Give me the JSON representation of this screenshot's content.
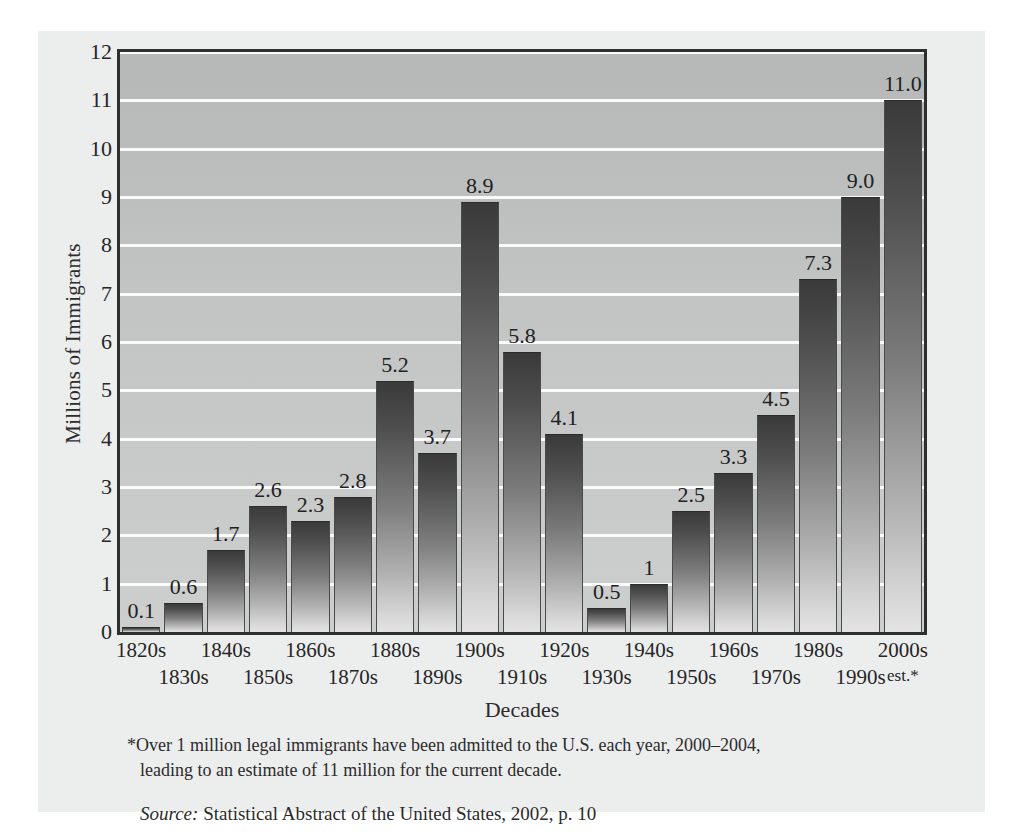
{
  "chart_data": {
    "type": "bar",
    "title": "",
    "xlabel": "Decades",
    "ylabel": "Millions of Immigrants",
    "ylim": [
      0,
      12
    ],
    "yticks": [
      0,
      1,
      2,
      3,
      4,
      5,
      6,
      7,
      8,
      9,
      10,
      11,
      12
    ],
    "grid": true,
    "legend": "none",
    "categories": [
      "1820s",
      "1830s",
      "1840s",
      "1850s",
      "1860s",
      "1870s",
      "1880s",
      "1890s",
      "1900s",
      "1910s",
      "1920s",
      "1930s",
      "1940s",
      "1950s",
      "1960s",
      "1970s",
      "1980s",
      "1990s",
      "2000s"
    ],
    "category_sublabels": [
      "",
      "",
      "",
      "",
      "",
      "",
      "",
      "",
      "",
      "",
      "",
      "",
      "",
      "",
      "",
      "",
      "",
      "",
      "est.*"
    ],
    "values": [
      0.1,
      0.6,
      1.7,
      2.6,
      2.3,
      2.8,
      5.2,
      3.7,
      8.9,
      5.8,
      4.1,
      0.5,
      1.0,
      2.5,
      3.3,
      4.5,
      7.3,
      9.0,
      11.0
    ],
    "value_labels": [
      "0.1",
      "0.6",
      "1.7",
      "2.6",
      "2.3",
      "2.8",
      "5.2",
      "3.7",
      "8.9",
      "5.8",
      "4.1",
      "0.5",
      "1",
      "2.5",
      "3.3",
      "4.5",
      "7.3",
      "9.0",
      "11.0"
    ],
    "colors": {
      "plot_background_top": "#b6b7b7",
      "plot_background_bottom": "#cdcece",
      "gridline": "#fbfbfb",
      "bar_top": "#3a3a3a",
      "bar_bottom": "#e3e3e3",
      "axis_border": "#2e2e2e",
      "panel_background": "#eceded",
      "text": "#2b2b2b"
    }
  },
  "notes": {
    "footnote_line1": "*Over 1 million legal immigrants have been admitted to the U.S. each year, 2000–2004,",
    "footnote_line2": "leading to an estimate of 11 million for the current decade.",
    "source_label": "Source:",
    "source_text": "Statistical Abstract of the United States, 2002, p. 10"
  }
}
